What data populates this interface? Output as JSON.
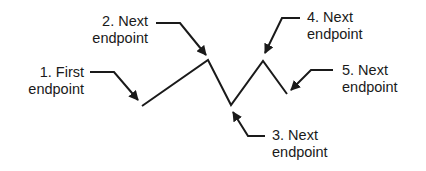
{
  "diagram": {
    "colors": {
      "line": "#1a1a1a",
      "background": "#ffffff"
    },
    "polyline": [
      [
        142,
        106
      ],
      [
        208,
        60
      ],
      [
        231,
        105
      ],
      [
        263,
        61
      ],
      [
        287,
        94
      ]
    ],
    "labels": [
      {
        "line1": "1.  First",
        "line2": "endpoint"
      },
      {
        "line1": "2.  Next",
        "line2": "endpoint"
      },
      {
        "line1": "3.  Next",
        "line2": "endpoint"
      },
      {
        "line1": "4.  Next",
        "line2": "endpoint"
      },
      {
        "line1": "5.  Next",
        "line2": "endpoint"
      }
    ]
  }
}
